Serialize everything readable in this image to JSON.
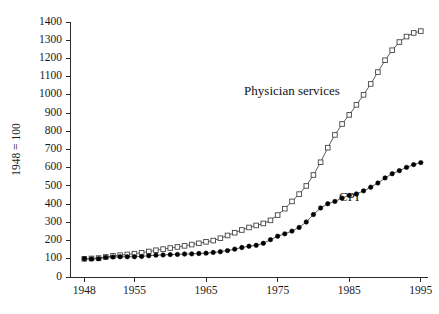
{
  "chart_data": {
    "type": "line",
    "title": "",
    "xlabel": "",
    "ylabel": "1948 = 100",
    "xlim": [
      1946,
      1996
    ],
    "ylim": [
      0,
      1400
    ],
    "grid": false,
    "legend_position": "inline-annotation",
    "x_ticks": [
      "1948",
      "1955",
      "1965",
      "1975",
      "1985",
      "1995"
    ],
    "x_tick_values": [
      1948,
      1955,
      1965,
      1975,
      1985,
      1995
    ],
    "y_ticks": [
      "0",
      "100",
      "200",
      "300",
      "400",
      "500",
      "600",
      "700",
      "800",
      "900",
      "1000",
      "1100",
      "1200",
      "1300",
      "1400"
    ],
    "y_tick_values": [
      0,
      100,
      200,
      300,
      400,
      500,
      600,
      700,
      800,
      900,
      1000,
      1100,
      1200,
      1300,
      1400
    ],
    "x": [
      1948,
      1949,
      1950,
      1951,
      1952,
      1953,
      1954,
      1955,
      1956,
      1957,
      1958,
      1959,
      1960,
      1961,
      1962,
      1963,
      1964,
      1965,
      1966,
      1967,
      1968,
      1969,
      1970,
      1971,
      1972,
      1973,
      1974,
      1975,
      1976,
      1977,
      1978,
      1979,
      1980,
      1981,
      1982,
      1983,
      1984,
      1985,
      1986,
      1987,
      1988,
      1989,
      1990,
      1991,
      1992,
      1993,
      1994,
      1995
    ],
    "series": [
      {
        "name": "Physician services",
        "marker": "open-square",
        "color": "#444444",
        "label_x": 1977,
        "label_y": 1000,
        "values": [
          100,
          102,
          104,
          110,
          116,
          120,
          124,
          128,
          133,
          140,
          147,
          153,
          159,
          165,
          171,
          178,
          185,
          193,
          200,
          213,
          228,
          243,
          258,
          272,
          283,
          294,
          311,
          340,
          375,
          415,
          455,
          500,
          560,
          630,
          710,
          780,
          840,
          890,
          945,
          1000,
          1060,
          1125,
          1190,
          1245,
          1290,
          1320,
          1340,
          1350
        ]
      },
      {
        "name": "CPI",
        "marker": "filled-circle",
        "color": "#000000",
        "label_x": 1985,
        "label_y": 420,
        "values": [
          100,
          99,
          100,
          108,
          110,
          111,
          111,
          111,
          113,
          117,
          120,
          121,
          123,
          124,
          126,
          127,
          129,
          131,
          135,
          139,
          145,
          153,
          162,
          169,
          174,
          185,
          205,
          224,
          237,
          252,
          272,
          302,
          343,
          379,
          402,
          415,
          433,
          448,
          456,
          473,
          493,
          516,
          544,
          567,
          584,
          602,
          617,
          628
        ]
      }
    ]
  },
  "annotations": [
    {
      "id": "physician-label",
      "text": "Physician services"
    },
    {
      "id": "cpi-label",
      "text": "CPI"
    }
  ],
  "axis": {
    "y_title": "1948 = 100"
  }
}
